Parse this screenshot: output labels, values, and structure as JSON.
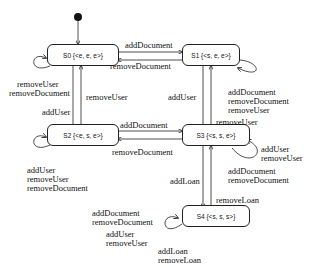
{
  "diagram": {
    "type": "state-machine",
    "states": [
      {
        "id": "S0",
        "label": "S0 {<e, e, e>}"
      },
      {
        "id": "S1",
        "label": "S1 {<s, e, e>}"
      },
      {
        "id": "S2",
        "label": "S2 {<e, s, e>}"
      },
      {
        "id": "S3",
        "label": "S3 {<s, s, e>}"
      },
      {
        "id": "S4",
        "label": "S4 {<s, s, s>}"
      }
    ],
    "transitions": [
      {
        "from": "S0",
        "to": "S1",
        "label": "addDocument"
      },
      {
        "from": "S1",
        "to": "S0",
        "label": "removeDocument"
      },
      {
        "from": "S0",
        "to": "S2",
        "label": "addUser"
      },
      {
        "from": "S2",
        "to": "S0",
        "label": "removeUser"
      },
      {
        "from": "S1",
        "to": "S3",
        "label": "addUser"
      },
      {
        "from": "S3",
        "to": "S1",
        "label": "removeUser"
      },
      {
        "from": "S2",
        "to": "S3",
        "label": "addDocument"
      },
      {
        "from": "S3",
        "to": "S2",
        "label": "removeDocument"
      },
      {
        "from": "S3",
        "to": "S4",
        "label": "addLoan"
      },
      {
        "from": "S4",
        "to": "S3",
        "label": "removeLoan"
      }
    ],
    "self_loops": {
      "S0": [
        "removeUser",
        "removeDocument"
      ],
      "S1": [
        "addDocument",
        "removeDocument",
        "removeUser"
      ],
      "S2": [
        "addUser",
        "removeUser",
        "removeDocument"
      ],
      "S3a": [
        "addUser",
        "removeUser"
      ],
      "S3b": [
        "addDocument",
        "removeDocument"
      ],
      "S4a": [
        "addDocument",
        "removeDocument"
      ],
      "S4b": [
        "addUser",
        "removeUser"
      ],
      "S4c": [
        "addLoan",
        "removeLoan"
      ]
    }
  }
}
